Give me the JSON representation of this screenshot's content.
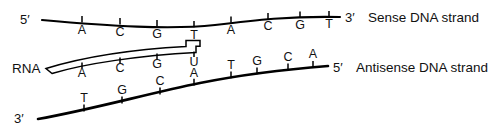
{
  "diagram": {
    "colors": {
      "ink": "#000000",
      "background": "#ffffff"
    },
    "strands": [
      {
        "id": "sense",
        "name_label": "Sense DNA strand",
        "left_end_label": "5′",
        "right_end_label": "3′",
        "bases": [
          "A",
          "C",
          "G",
          "T",
          "A",
          "C",
          "G",
          "T"
        ],
        "base_x": [
          82,
          120,
          157,
          194,
          231,
          268,
          300,
          329
        ],
        "base_y": 30,
        "label_x": 372,
        "label_y": 19,
        "left_prime_x": 20,
        "left_prime_y": 20,
        "right_prime_x": 345,
        "right_prime_y": 19
      },
      {
        "id": "rna",
        "name_label": "RNA",
        "bases": [
          "A",
          "C",
          "G",
          "U"
        ],
        "base_x": [
          82,
          120,
          157,
          194
        ],
        "base_y": 72,
        "label_x": 14,
        "label_y": 72
      },
      {
        "id": "antisense",
        "name_label": "Antisense DNA strand",
        "left_end_label": "3′",
        "right_end_label": "5′",
        "bases_below": [
          "T",
          "G",
          "C"
        ],
        "bases_below_x": [
          84,
          122,
          160
        ],
        "bases_above": [
          "A",
          "T",
          "G",
          "C",
          "A"
        ],
        "bases_above_x": [
          194,
          231,
          257,
          288,
          313
        ],
        "label_x": 362,
        "label_y": 69,
        "left_prime_x": 18,
        "left_prime_y": 119,
        "right_prime_x": 333,
        "right_prime_y": 69
      }
    ]
  }
}
